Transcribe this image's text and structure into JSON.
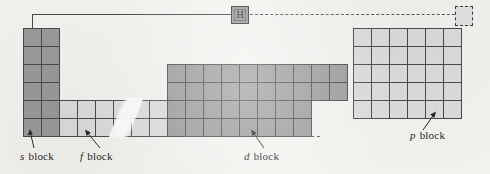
{
  "figure": {
    "background_color": "#f4f2ef",
    "dark_block_color": "#9a9a9a",
    "light_block_color": "#dcdcdc",
    "line_color": "#4a4a4a"
  },
  "hydrogen_cell": {
    "symbol": "H",
    "fill_color": "#9a9a9a"
  },
  "helium_cell": {
    "symbol": "",
    "style": "dashed-outline",
    "fill_color": "#e2e2e2"
  },
  "labels": {
    "s_block": {
      "italic": "s",
      "text": " block"
    },
    "f_block": {
      "italic": "f",
      "text": " block"
    },
    "d_block": {
      "italic": "d",
      "text": " block"
    },
    "p_block": {
      "italic": "p",
      "text": " block"
    }
  },
  "blocks": [
    {
      "name": "s-block",
      "columns": 2,
      "rows": 6,
      "shade": "dark"
    },
    {
      "name": "f-block",
      "columns": 14,
      "rows": 2,
      "shade": "light"
    },
    {
      "name": "d-block",
      "columns": 10,
      "rows": 4,
      "shade": "dark"
    },
    {
      "name": "p-block",
      "columns": 6,
      "rows": 5,
      "shade": "light"
    }
  ]
}
